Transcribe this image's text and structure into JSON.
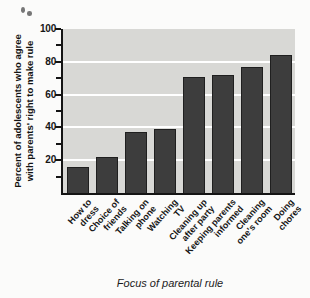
{
  "figure": {
    "y_axis_title_line1": "Percent of adolescents who agree",
    "y_axis_title_line2": "with parents' right to make rule"
  },
  "chart_data": {
    "type": "bar",
    "categories": [
      "How to\ndress",
      "Choice of\nfriends",
      "Talking on\nphone",
      "Watching\nTV",
      "Cleaning up\nafter party",
      "Keeping parents\ninformed",
      "Cleaning\none's room",
      "Doing\nchores"
    ],
    "values": [
      16,
      22,
      37,
      39,
      71,
      72,
      77,
      84
    ],
    "title": "",
    "xlabel": "Focus of parental rule",
    "ylabel": "Percent of adolescents who agree with parents' right to make rule",
    "ylim": [
      0,
      100
    ],
    "ytick_major": [
      20,
      40,
      60,
      80,
      100
    ],
    "ytick_minor_step": 10,
    "gridlines": "white horizontal lines at major ticks",
    "legend": "none",
    "colors": {
      "bar": "#3d3d3d",
      "bar_border": "#1f1f1f",
      "plot_background": "#d8d8d5",
      "gridline": "#ffffff",
      "axis": "#141414",
      "page_background": "#fbfbfa"
    }
  }
}
